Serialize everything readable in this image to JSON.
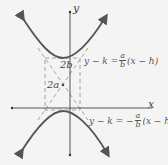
{
  "diagram": {
    "type": "hyperbola-vertical-transverse-axis",
    "axes": {
      "x_label": "x",
      "y_label": "y"
    },
    "labels": {
      "conjugate_axis": "2b",
      "transverse_axis": "2a"
    },
    "asymptotes": {
      "positive": {
        "lhs": "y − k = ",
        "num": "a",
        "den": "b",
        "rhs": "(x − h)"
      },
      "negative": {
        "lhs": "y − k = −",
        "num": "a",
        "den": "b",
        "rhs": "(x − h)"
      }
    },
    "colors": {
      "curve": "#555555",
      "axis": "#444444",
      "dashed": "#999999",
      "background": "#f4f4f4"
    }
  }
}
